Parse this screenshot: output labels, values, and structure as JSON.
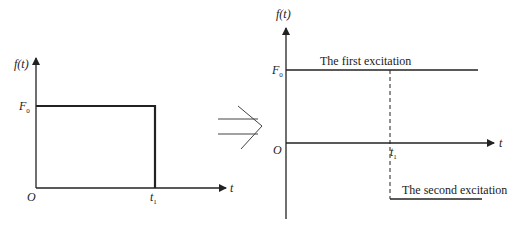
{
  "left_plot": {
    "y_label": "f(t)",
    "x_label": "t",
    "origin_label": "O",
    "level_label": "F",
    "level_subscript": "0",
    "t1_label": "t",
    "t1_subscript": "1"
  },
  "transform_arrow": "implies",
  "right_plot": {
    "y_label": "f(t)",
    "x_label": "t",
    "origin_label": "O",
    "level_label": "F",
    "level_subscript": "0",
    "t1_label": "t",
    "t1_subscript": "1",
    "first_excitation_label": "The first excitation",
    "second_excitation_label": "The second excitation"
  },
  "colors": {
    "stroke": "#222222",
    "background": "#ffffff"
  }
}
